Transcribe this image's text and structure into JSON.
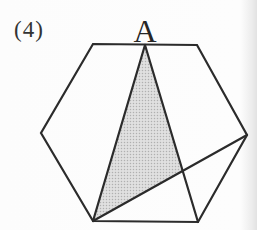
{
  "figure": {
    "label": "(4)",
    "vertex_label": "A",
    "colors": {
      "line": "#2b2b2b",
      "shade_base": "#e0e0e0",
      "shade_dot": "#b0b0b0",
      "background": "#fcfcfc",
      "label_text": "#333333"
    },
    "hexagon": {
      "points": "93,44 197,45 247,135 198,222 93,221 41,133"
    },
    "shaded_triangle": {
      "points": "145,46 183,171 93,221"
    },
    "segments": [
      {
        "name": "segment-A-to-bottom-left-vertex",
        "d": "M145,45 L93,221"
      },
      {
        "name": "segment-A-to-bottom-right-vertex",
        "d": "M145,45 L198,222"
      },
      {
        "name": "segment-bottom-left-to-right-vertex",
        "d": "M93,221 L247,135"
      }
    ]
  }
}
